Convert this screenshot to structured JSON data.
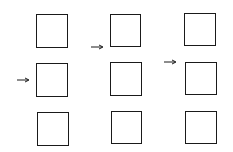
{
  "diagram": {
    "stroke_color": "#1a1a1a",
    "columns": [
      {
        "index": 1,
        "arrow_row": 2,
        "boxes": [
          {
            "x": 36,
            "y": 14,
            "w": 32,
            "h": 34
          },
          {
            "x": 36,
            "y": 63,
            "w": 32,
            "h": 34
          },
          {
            "x": 37,
            "y": 112,
            "w": 32,
            "h": 34
          }
        ],
        "arrow": {
          "x": 17,
          "y": 80,
          "len": 12
        }
      },
      {
        "index": 2,
        "arrow_row": "between 1 and 2",
        "boxes": [
          {
            "x": 110,
            "y": 14,
            "w": 31,
            "h": 33
          },
          {
            "x": 110,
            "y": 62,
            "w": 32,
            "h": 34
          },
          {
            "x": 111,
            "y": 111,
            "w": 31,
            "h": 33
          }
        ],
        "arrow": {
          "x": 91,
          "y": 47,
          "len": 12
        }
      },
      {
        "index": 3,
        "arrow_row": "upper part of 2",
        "boxes": [
          {
            "x": 184,
            "y": 13,
            "w": 32,
            "h": 33
          },
          {
            "x": 185,
            "y": 62,
            "w": 32,
            "h": 33
          },
          {
            "x": 185,
            "y": 111,
            "w": 32,
            "h": 33
          }
        ],
        "arrow": {
          "x": 164,
          "y": 62,
          "len": 12
        }
      }
    ]
  }
}
